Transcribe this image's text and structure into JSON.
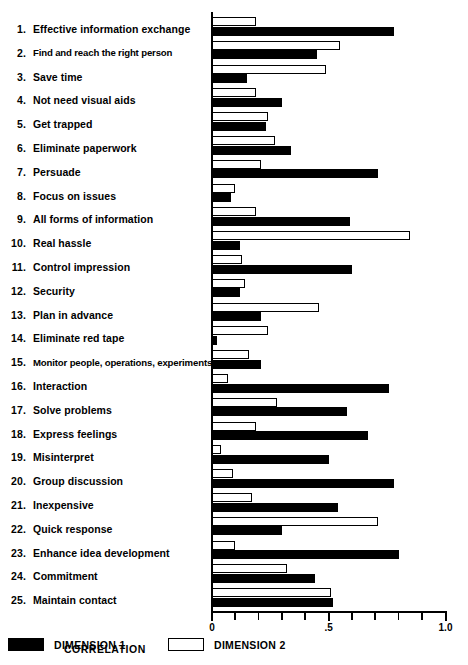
{
  "chart_data": {
    "type": "bar",
    "orientation": "horizontal",
    "title": "",
    "xlabel": "CORRELATION",
    "ylabel": "",
    "xlim": [
      0,
      1.0
    ],
    "grid": false,
    "legend_position": "bottom",
    "tick_labels": [
      "0",
      ".5",
      "1.0"
    ],
    "tick_values": [
      0,
      0.5,
      1.0
    ],
    "minor_tick_values": [
      0.1,
      0.2,
      0.3,
      0.4,
      0.6,
      0.7,
      0.8,
      0.9
    ],
    "categories": [
      "Effective information exchange",
      "Find and reach the right person",
      "Save time",
      "Not need visual aids",
      "Get trapped",
      "Eliminate paperwork",
      "Persuade",
      "Focus on issues",
      "All forms of information",
      "Real hassle",
      "Control impression",
      "Security",
      "Plan in advance",
      "Eliminate red tape",
      "Monitor people, operations, experiments",
      "Interaction",
      "Solve problems",
      "Express feelings",
      "Misinterpret",
      "Group discussion",
      "Inexpensive",
      "Quick response",
      "Enhance idea development",
      "Commitment",
      "Maintain contact"
    ],
    "numbers": [
      "1.",
      "2.",
      "3.",
      "4.",
      "5.",
      "6.",
      "7.",
      "8.",
      "9.",
      "10.",
      "11.",
      "12.",
      "13.",
      "14.",
      "15.",
      "16.",
      "17.",
      "18.",
      "19.",
      "20.",
      "21.",
      "22.",
      "23.",
      "24.",
      "25."
    ],
    "series": [
      {
        "name": "DIMENSION 1",
        "color": "#000000",
        "values": [
          0.78,
          0.45,
          0.15,
          0.3,
          0.23,
          0.34,
          0.71,
          0.08,
          0.59,
          0.12,
          0.6,
          0.12,
          0.21,
          0.02,
          0.21,
          0.76,
          0.58,
          0.67,
          0.5,
          0.78,
          0.54,
          0.3,
          0.8,
          0.44,
          0.52
        ]
      },
      {
        "name": "DIMENSION 2",
        "color": "#ffffff",
        "values": [
          0.19,
          0.55,
          0.49,
          0.19,
          0.24,
          0.27,
          0.21,
          0.1,
          0.19,
          0.85,
          0.13,
          0.14,
          0.46,
          0.24,
          0.16,
          0.07,
          0.28,
          0.19,
          0.04,
          0.09,
          0.17,
          0.71,
          0.1,
          0.32,
          0.51
        ]
      }
    ]
  },
  "legend": {
    "items": [
      {
        "label": "DIMENSION 1",
        "swatch": "filled-black-swatch"
      },
      {
        "label": "DIMENSION 2",
        "swatch": "outline-white-swatch"
      }
    ]
  },
  "axis": {
    "x_title": "CORRELATION"
  }
}
